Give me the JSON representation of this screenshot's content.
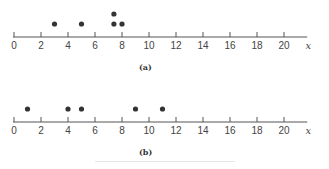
{
  "chart_data": [
    {
      "type": "scatter",
      "subtype": "dot-plot",
      "label": "(a)",
      "xlabel": "x",
      "xlim": [
        0,
        21.5
      ],
      "xticks": [
        0,
        2,
        4,
        6,
        8,
        10,
        12,
        14,
        16,
        18,
        20
      ],
      "points": [
        {
          "x": 3,
          "stack": 1
        },
        {
          "x": 5,
          "stack": 1
        },
        {
          "x": 7.4,
          "stack": 1
        },
        {
          "x": 7.4,
          "stack": 2
        },
        {
          "x": 8,
          "stack": 1
        }
      ],
      "grid": false
    },
    {
      "type": "scatter",
      "subtype": "dot-plot",
      "label": "(b)",
      "xlabel": "x",
      "xlim": [
        0,
        21.5
      ],
      "xticks": [
        0,
        2,
        4,
        6,
        8,
        10,
        12,
        14,
        16,
        18,
        20
      ],
      "points": [
        {
          "x": 1,
          "stack": 1
        },
        {
          "x": 4,
          "stack": 1
        },
        {
          "x": 5,
          "stack": 1
        },
        {
          "x": 9,
          "stack": 1
        },
        {
          "x": 11,
          "stack": 1
        }
      ],
      "grid": false
    }
  ],
  "panels": {
    "a": {
      "label": "(a)"
    },
    "b": {
      "label": "(b)"
    }
  },
  "colors": {
    "axis": "#555555",
    "dot": "#333333"
  }
}
